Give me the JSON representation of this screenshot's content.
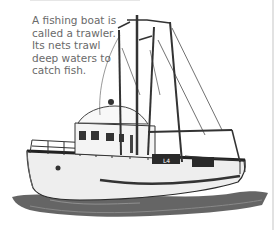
{
  "caption": {
    "lines": [
      "A fishing boat is",
      "called a trawler.",
      "Its nets trawl",
      "deep waters to",
      "catch fish."
    ]
  },
  "illustration": {
    "subject": "fishing trawler",
    "hull_marking": "L4",
    "colors": {
      "hull": "#f0f0f0",
      "outline": "#2a2a2a",
      "water": "#3a3a3a",
      "text": "#6a6a6a"
    }
  }
}
